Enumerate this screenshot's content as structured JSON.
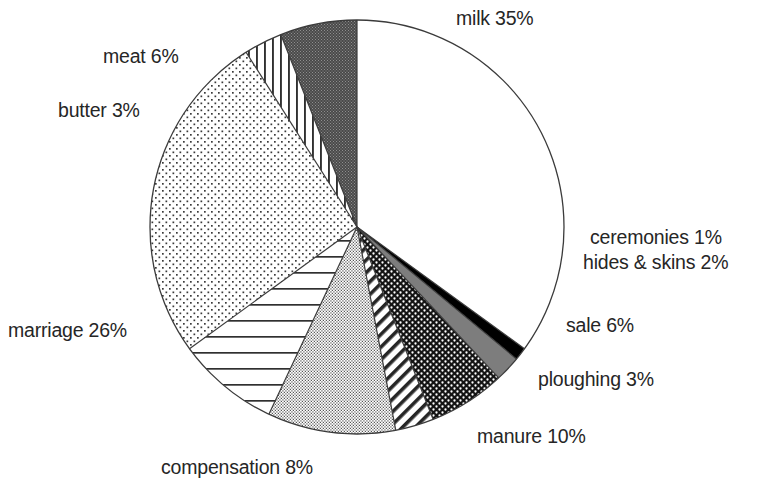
{
  "chart_data": {
    "type": "pie",
    "title": "",
    "subtitle": "",
    "xlabel": "",
    "ylabel": "",
    "legend_position": "none",
    "grid": false,
    "start_angle_deg": 0,
    "direction": "clockwise",
    "units": "percent",
    "total": 100,
    "categories": [
      "milk",
      "ceremonies",
      "hides & skins",
      "sale",
      "ploughing",
      "manure",
      "compensation",
      "marriage",
      "butter",
      "meat"
    ],
    "values": [
      35,
      1,
      2,
      6,
      3,
      10,
      8,
      26,
      3,
      6
    ],
    "labels": [
      "milk 35%",
      "ceremonies 1%",
      "hides & skins 2%",
      "sale 6%",
      "ploughing 3%",
      "manure 10%",
      "compensation 8%",
      "marriage 26%",
      "butter 3%",
      "meat 6%"
    ],
    "slices": [
      {
        "name": "milk",
        "value": 35,
        "label": "milk 35%",
        "fill": "white",
        "pattern": "none"
      },
      {
        "name": "ceremonies",
        "value": 1,
        "label": "ceremonies 1%",
        "fill": "#000000",
        "pattern": "solid-black"
      },
      {
        "name": "hides & skins",
        "value": 2,
        "label": "hides & skins 2%",
        "fill": "#808080",
        "pattern": "solid-gray"
      },
      {
        "name": "sale",
        "value": 6,
        "label": "sale 6%",
        "fill": "#1a1a1a",
        "pattern": "dark-stipple"
      },
      {
        "name": "ploughing",
        "value": 3,
        "label": "ploughing 3%",
        "fill": "white",
        "pattern": "diagonal-stripes"
      },
      {
        "name": "manure",
        "value": 10,
        "label": "manure 10%",
        "fill": "white",
        "pattern": "fine-dots-dense"
      },
      {
        "name": "compensation",
        "value": 8,
        "label": "compensation 8%",
        "fill": "white",
        "pattern": "horizontal-stripes"
      },
      {
        "name": "marriage",
        "value": 26,
        "label": "marriage 26%",
        "fill": "white",
        "pattern": "light-dots"
      },
      {
        "name": "butter",
        "value": 3,
        "label": "butter 3%",
        "fill": "white",
        "pattern": "vertical-stripes"
      },
      {
        "name": "meat",
        "value": 6,
        "label": "meat 6%",
        "fill": "#4d4d4d",
        "pattern": "mid-stipple"
      }
    ],
    "colors": {
      "background": "#ffffff",
      "outline": "#3b3b3b",
      "text": "#262626"
    }
  },
  "labels": {
    "milk": "milk 35%",
    "meat": "meat 6%",
    "butter": "butter 3%",
    "marriage": "marriage 26%",
    "compensation": "compensation 8%",
    "manure": "manure 10%",
    "ploughing": "ploughing 3%",
    "sale": "sale 6%",
    "ceremonies": "ceremonies 1%",
    "hides": "hides & skins 2%"
  }
}
